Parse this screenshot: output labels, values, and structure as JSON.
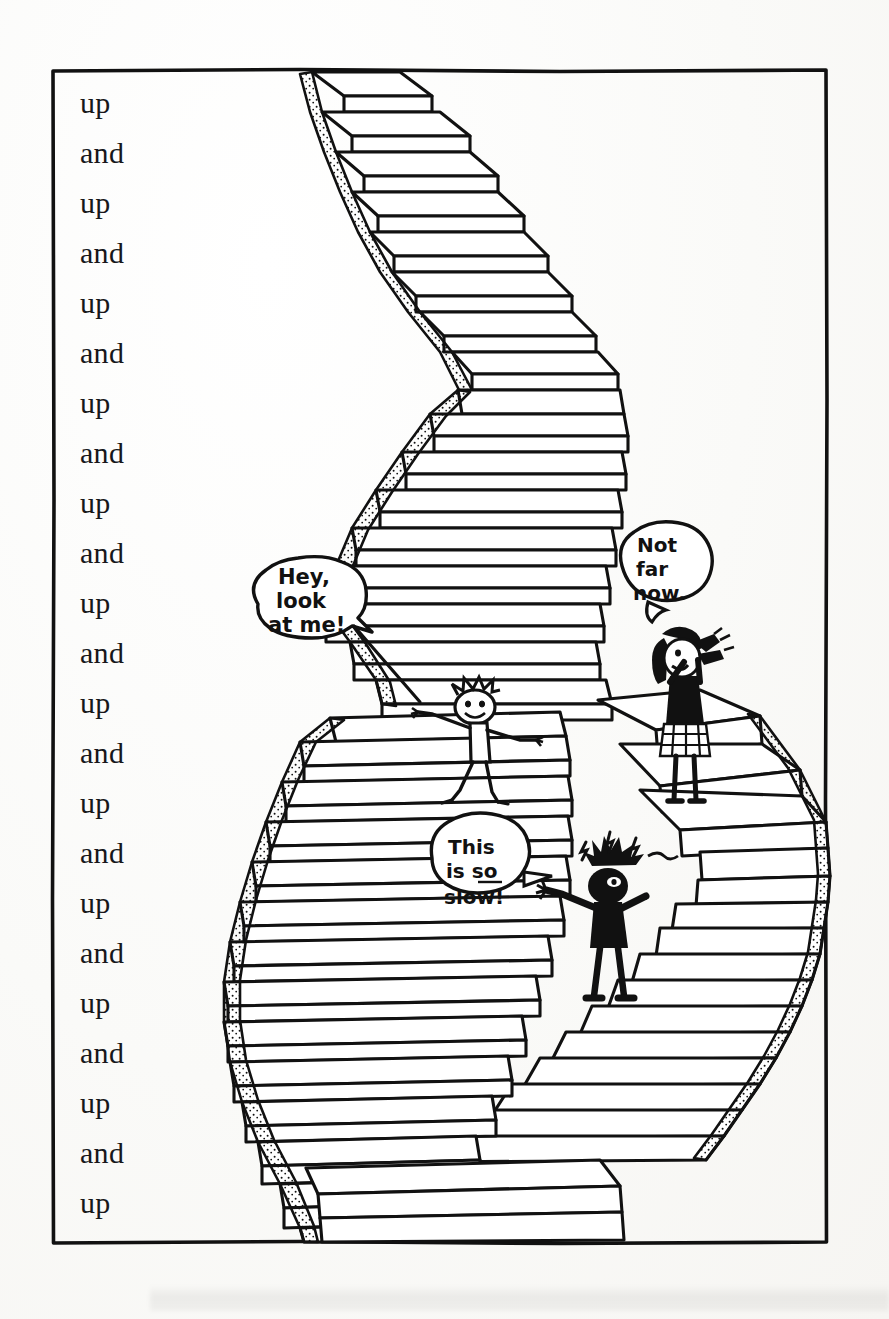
{
  "illustration": {
    "title": "Up and Up - endless staircase comic panel",
    "medium": "black ink line drawing on off-white paper",
    "frame": {
      "stroke_color": "#111111",
      "background_color": "#fbfbf9"
    }
  },
  "text_column": {
    "name": "repeating-up-and-chant",
    "lines": [
      "up",
      "and",
      "up",
      "and",
      "up",
      "and",
      "up",
      "and",
      "up",
      "and",
      "up",
      "and",
      "up",
      "and",
      "up",
      "and",
      "up",
      "and",
      "up",
      "and",
      "up",
      "and",
      "up"
    ]
  },
  "speech_bubbles": [
    {
      "id": "bubble-hey-look-at-me",
      "speaker": "falling-child",
      "lines": [
        "Hey,",
        "look",
        "at me!"
      ],
      "underline": null
    },
    {
      "id": "bubble-not-far-now",
      "speaker": "shouting-girl",
      "lines": [
        "Not",
        "far",
        "now."
      ],
      "underline": null
    },
    {
      "id": "bubble-this-is-so-slow",
      "speaker": "frustrated-kid",
      "lines": [
        "This",
        "is so",
        "slow!"
      ],
      "underline": "so"
    }
  ],
  "characters": [
    {
      "id": "falling-child",
      "description": "child with spiky hair tumbling down the stairs, arms outstretched"
    },
    {
      "id": "shouting-girl",
      "description": "girl with dark bobbed hair and checkered skirt, hands cupped around mouth, standing on a step"
    },
    {
      "id": "frustrated-kid",
      "description": "kid in dark clothes with spiky hair, anger marks above head, arms raised in exasperation"
    }
  ],
  "scene": {
    "subject": "a long winding staircase that zigzags from the bottom of the panel to the top",
    "step_count_visible": 70,
    "style_notes": "stippled dotted shading along the outer stair edges"
  }
}
